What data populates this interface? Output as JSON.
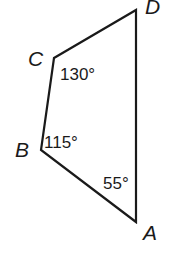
{
  "diagram": {
    "type": "quadrilateral",
    "vertices": [
      {
        "id": "A",
        "label": "A",
        "x": 136,
        "y": 222,
        "label_x": 143,
        "label_y": 240
      },
      {
        "id": "B",
        "label": "B",
        "x": 41,
        "y": 150,
        "label_x": 15,
        "label_y": 157
      },
      {
        "id": "C",
        "label": "C",
        "x": 54,
        "y": 58,
        "label_x": 28,
        "label_y": 66
      },
      {
        "id": "D",
        "label": "D",
        "x": 136,
        "y": 10,
        "label_x": 145,
        "label_y": 14
      }
    ],
    "angles": [
      {
        "vertex": "C",
        "label": "130°",
        "x": 60,
        "y": 80
      },
      {
        "vertex": "B",
        "label": "115°",
        "x": 44,
        "y": 148
      },
      {
        "vertex": "A",
        "label": "55°",
        "x": 103,
        "y": 189
      }
    ],
    "stroke_color": "#1a1a1a"
  }
}
